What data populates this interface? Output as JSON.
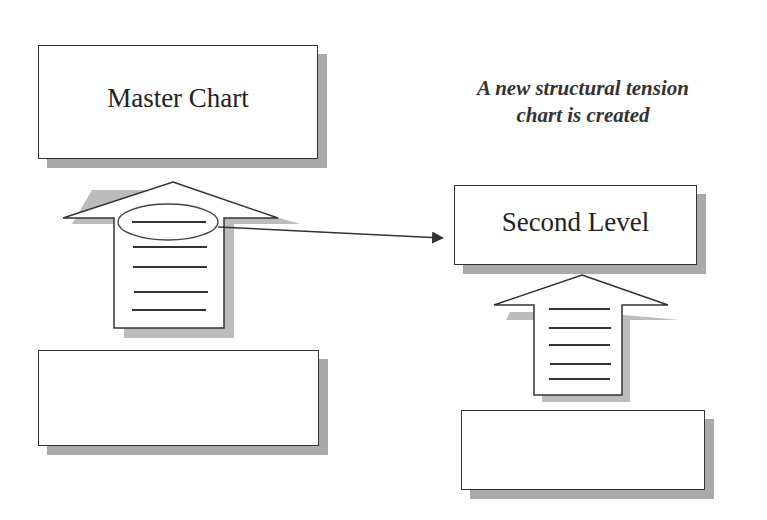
{
  "diagram": {
    "master_chart": {
      "label": "Master Chart"
    },
    "second_level": {
      "label": "Second Level"
    },
    "caption": {
      "line1": "A new structural tension",
      "line2": "chart is created"
    },
    "bottom_left_box": {
      "label": ""
    },
    "bottom_right_box": {
      "label": ""
    },
    "left_arrow": {
      "lines": 5,
      "highlighted_line": 1
    },
    "right_arrow": {
      "lines": 5
    },
    "connector": {
      "from": "left_arrow.line_1",
      "to": "second_level"
    }
  },
  "colors": {
    "stroke": "#333333",
    "shadow": "#a9a9a9",
    "background": "#ffffff"
  }
}
